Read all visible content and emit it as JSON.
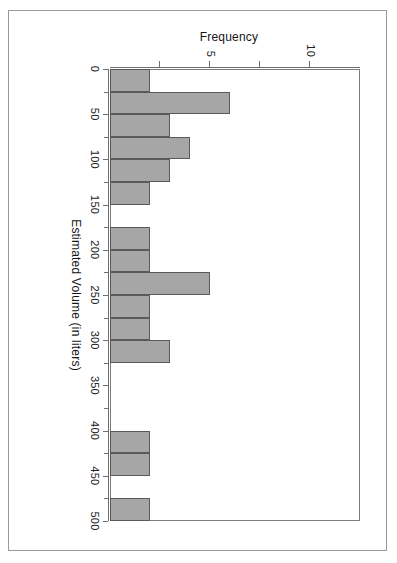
{
  "document": {
    "type": "scanned-figure",
    "page_background": "#ffffff",
    "frame_color": "#9a9a9a"
  },
  "chart_data": {
    "type": "bar",
    "subtype": "histogram",
    "orientation": "rotated-90",
    "title": "",
    "xlabel": "Estimated Volume (in liters)",
    "ylabel": "Frequency",
    "bin_width": 25,
    "xlim": [
      0,
      500
    ],
    "ylim": [
      0,
      12.5
    ],
    "grid": false,
    "legend": null,
    "bar_fill": "#a6a6a6",
    "bar_border": "#5a5a5a",
    "axis_color": "#6f6f6f",
    "x_ticks": [
      0,
      50,
      100,
      150,
      200,
      250,
      300,
      350,
      400,
      450,
      500
    ],
    "x_tick_labels": [
      "0",
      "50",
      "100",
      "150",
      "200",
      "250",
      "300",
      "350",
      "400",
      "450",
      "500"
    ],
    "x_minor_ticks": [
      25,
      75,
      125,
      175,
      225,
      275,
      325,
      375,
      425,
      475
    ],
    "y_ticks": [
      2.5,
      5,
      7.5,
      10
    ],
    "y_tick_labels": [
      "",
      "5",
      "",
      "10"
    ],
    "bin_starts": [
      0,
      25,
      50,
      75,
      100,
      125,
      150,
      175,
      200,
      225,
      250,
      275,
      300,
      325,
      350,
      375,
      400,
      425,
      450,
      475
    ],
    "bin_ends": [
      25,
      50,
      75,
      100,
      125,
      150,
      175,
      200,
      225,
      250,
      275,
      300,
      325,
      350,
      375,
      400,
      425,
      450,
      475,
      500
    ],
    "categories": [
      "0-25",
      "25-50",
      "50-75",
      "75-100",
      "100-125",
      "125-150",
      "150-175",
      "175-200",
      "200-225",
      "225-250",
      "250-275",
      "275-300",
      "300-325",
      "325-350",
      "350-375",
      "375-400",
      "400-425",
      "425-450",
      "450-475",
      "475-500"
    ],
    "values": [
      2,
      6,
      3,
      4,
      3,
      2,
      0,
      2,
      2,
      5,
      2,
      2,
      3,
      0,
      0,
      0,
      2,
      2,
      0,
      2
    ]
  }
}
